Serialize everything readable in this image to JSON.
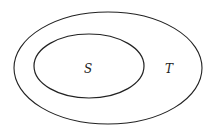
{
  "diagram": {
    "type": "venn-subset",
    "sets": [
      {
        "id": "T",
        "label": "T",
        "role": "outer"
      },
      {
        "id": "S",
        "label": "S",
        "role": "inner"
      }
    ],
    "relation": "S is a subset of T",
    "stroke_color": "#222222",
    "background": "#ffffff"
  }
}
